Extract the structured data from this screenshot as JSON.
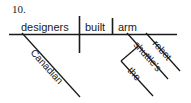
{
  "item": {
    "number": "10."
  },
  "diagram": {
    "type": "reed-kellogg-sentence-diagram",
    "sentence": "Canadian designers built the shuttle's robot arm",
    "ink_color": "#1a1a1a",
    "background_color": "#ffffff",
    "baseline": {
      "subject": "designers",
      "verb": "built",
      "object": "arm"
    },
    "modifiers": [
      {
        "word": "Canadian",
        "modifies": "designers",
        "slant": "down-right"
      },
      {
        "word": "robot",
        "modifies": "arm",
        "slant": "down-right"
      },
      {
        "word": "shuttle's",
        "modifies": "arm",
        "slant": "down-right"
      },
      {
        "word": "the",
        "modifies": "shuttle's",
        "slant": "down-right"
      }
    ],
    "dividers": [
      {
        "name": "subject-verb-divider",
        "crosses_baseline": true
      },
      {
        "name": "verb-object-divider",
        "crosses_baseline": false
      }
    ]
  }
}
